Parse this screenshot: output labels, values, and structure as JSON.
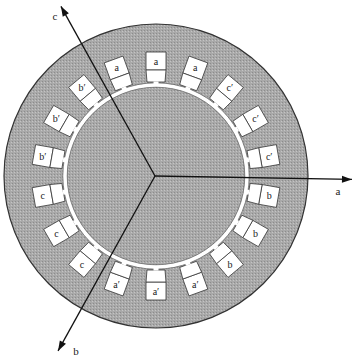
{
  "diagram": {
    "title": "",
    "center": {
      "x": 156,
      "y": 176
    },
    "stator": {
      "outer_radius": 152,
      "bore_radius": 88,
      "fill": "#a9a9a9",
      "stroke": "#333333"
    },
    "slot": {
      "outer_radius": 124,
      "mid_radius": 106,
      "inner_radius": 90,
      "outer_half_width": 10,
      "inner_half_width": 9,
      "neck_half_width": 2.5,
      "fill": "#ffffff"
    },
    "slots": [
      {
        "angle": 90,
        "label": "a"
      },
      {
        "angle": 70,
        "label": "a"
      },
      {
        "angle": 50,
        "label": "c′"
      },
      {
        "angle": 30,
        "label": "c′"
      },
      {
        "angle": 10,
        "label": "c′"
      },
      {
        "angle": -10,
        "label": "b"
      },
      {
        "angle": -30,
        "label": "b"
      },
      {
        "angle": -50,
        "label": "b"
      },
      {
        "angle": -70,
        "label": "a′"
      },
      {
        "angle": -90,
        "label": "a′"
      },
      {
        "angle": -110,
        "label": "a′"
      },
      {
        "angle": -130,
        "label": "c"
      },
      {
        "angle": -150,
        "label": "c"
      },
      {
        "angle": -170,
        "label": "c"
      },
      {
        "angle": 170,
        "label": "b′"
      },
      {
        "angle": 150,
        "label": "b′"
      },
      {
        "angle": 130,
        "label": "b′"
      },
      {
        "angle": 110,
        "label": "a"
      }
    ],
    "axes": [
      {
        "name": "a",
        "label": "a",
        "angle": -1,
        "length": 197,
        "label_dx": 14,
        "label_dy": 16
      },
      {
        "name": "b",
        "label": "b",
        "angle": -119,
        "length": 200,
        "label_dx": 14,
        "label_dy": 4
      },
      {
        "name": "c",
        "label": "c",
        "angle": 119,
        "length": 194,
        "label_dx": -10,
        "label_dy": 14
      }
    ]
  }
}
